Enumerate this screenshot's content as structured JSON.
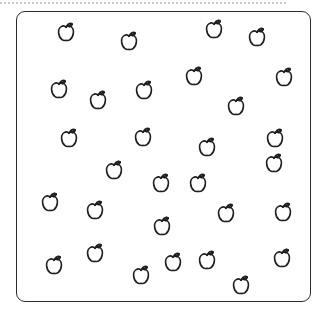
{
  "page": {
    "background_color": "#ffffff"
  },
  "top_rule": {
    "style": "dotted",
    "color": "#c9c9c9",
    "x": 0,
    "y": 2,
    "width": 286
  },
  "apple_box": {
    "name": "apple-container",
    "shape": "rounded-rectangle",
    "stroke_color": "#2b2b2b",
    "fill_color": "#ffffff",
    "corner_radius": 9,
    "x": 16,
    "y": 11,
    "width": 295,
    "height": 291
  },
  "apples": {
    "icon_name": "apple-icon",
    "stroke_color": "#1f1f1f",
    "fill_color": "none",
    "count": 36,
    "size": 21,
    "items": [
      {
        "id": 1,
        "x": 65,
        "y": 32
      },
      {
        "id": 2,
        "x": 128,
        "y": 41
      },
      {
        "id": 3,
        "x": 213,
        "y": 29
      },
      {
        "id": 4,
        "x": 256,
        "y": 37
      },
      {
        "id": 5,
        "x": 58,
        "y": 89
      },
      {
        "id": 6,
        "x": 97,
        "y": 100
      },
      {
        "id": 7,
        "x": 143,
        "y": 90
      },
      {
        "id": 8,
        "x": 193,
        "y": 76
      },
      {
        "id": 9,
        "x": 283,
        "y": 77
      },
      {
        "id": 10,
        "x": 235,
        "y": 106
      },
      {
        "id": 11,
        "x": 68,
        "y": 138
      },
      {
        "id": 12,
        "x": 142,
        "y": 137
      },
      {
        "id": 13,
        "x": 206,
        "y": 147
      },
      {
        "id": 14,
        "x": 274,
        "y": 138
      },
      {
        "id": 15,
        "x": 273,
        "y": 163
      },
      {
        "id": 16,
        "x": 113,
        "y": 170
      },
      {
        "id": 17,
        "x": 160,
        "y": 183
      },
      {
        "id": 18,
        "x": 197,
        "y": 183
      },
      {
        "id": 19,
        "x": 49,
        "y": 202
      },
      {
        "id": 20,
        "x": 94,
        "y": 210
      },
      {
        "id": 21,
        "x": 161,
        "y": 226
      },
      {
        "id": 22,
        "x": 225,
        "y": 213
      },
      {
        "id": 23,
        "x": 282,
        "y": 212
      },
      {
        "id": 24,
        "x": 53,
        "y": 265
      },
      {
        "id": 25,
        "x": 94,
        "y": 253
      },
      {
        "id": 26,
        "x": 140,
        "y": 275
      },
      {
        "id": 27,
        "x": 172,
        "y": 262
      },
      {
        "id": 28,
        "x": 206,
        "y": 260
      },
      {
        "id": 29,
        "x": 240,
        "y": 285
      },
      {
        "id": 30,
        "x": 281,
        "y": 258
      }
    ]
  }
}
